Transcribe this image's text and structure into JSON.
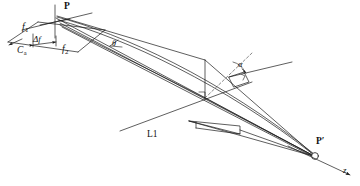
{
  "figure": {
    "type": "optical-ray-diagram",
    "background_color": "#ffffff",
    "line_color": "#1a1a1a",
    "dashed_color": "#555555"
  },
  "labels": [
    {
      "id": "P",
      "text": "P",
      "sub": "",
      "style": "bold",
      "x": 64,
      "y": 4,
      "size": 9.5
    },
    {
      "id": "f1",
      "text": "f",
      "sub": "1",
      "style": "italic",
      "x": 22,
      "y": 24,
      "size": 10
    },
    {
      "id": "deltaf",
      "text": "Δf",
      "sub": "",
      "style": "italic",
      "x": 35,
      "y": 38,
      "size": 9
    },
    {
      "id": "Ca",
      "text": "C",
      "sub": "a",
      "style": "italic",
      "x": 19,
      "y": 48,
      "size": 9.5
    },
    {
      "id": "f2",
      "text": "f",
      "sub": "2",
      "style": "italic",
      "x": 62,
      "y": 46,
      "size": 10
    },
    {
      "id": "theta",
      "text": "θ",
      "sub": "",
      "style": "italic",
      "x": 113,
      "y": 43,
      "size": 8
    },
    {
      "id": "alpha",
      "text": "α",
      "sub": "",
      "style": "italic",
      "x": 238,
      "y": 63,
      "size": 8.5
    },
    {
      "id": "L1",
      "text": "L1",
      "sub": "",
      "style": "plain",
      "x": 147,
      "y": 132,
      "size": 9.5
    },
    {
      "id": "Pprime",
      "text": "P′",
      "sub": "",
      "style": "bold",
      "x": 315,
      "y": 139,
      "size": 9.5
    },
    {
      "id": "z",
      "text": "z",
      "sub": "",
      "style": "italic",
      "x": 343,
      "y": 168,
      "size": 9
    }
  ],
  "points": {
    "P": {
      "x": 55,
      "y": 15
    },
    "P_prime": {
      "x": 315,
      "y": 156
    },
    "vertex_L1": {
      "x": 205,
      "y": 98
    },
    "vertex_top": {
      "x": 205,
      "y": 60
    },
    "alpha_vertex": {
      "x": 229,
      "y": 77
    }
  },
  "geometry": {
    "rays_from_P_to_Pprime": 4,
    "aperture_quadrilateral": [
      [
        8,
        42
      ],
      [
        38,
        22
      ],
      [
        105,
        30
      ],
      [
        78,
        52
      ]
    ],
    "z_axis": {
      "from": [
        288,
        146
      ],
      "to": [
        352,
        176
      ]
    }
  }
}
